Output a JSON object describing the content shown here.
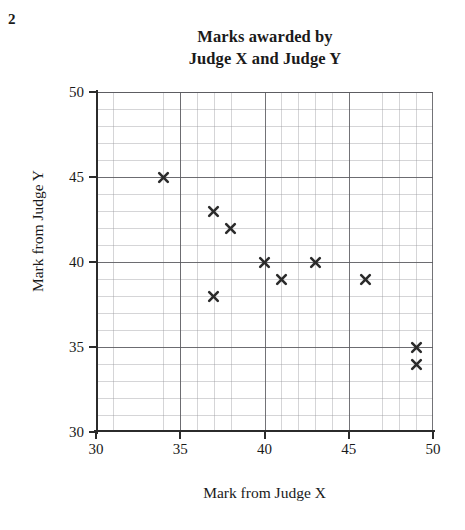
{
  "question_number": "2",
  "chart_data": {
    "type": "scatter",
    "title": "Marks awarded by Judge X and Judge Y",
    "title_lines": [
      "Marks awarded by",
      "Judge X and Judge Y"
    ],
    "xlabel": "Mark from Judge X",
    "ylabel": "Mark from Judge Y",
    "xlim": [
      30,
      50
    ],
    "ylim": [
      30,
      50
    ],
    "x_ticks": [
      30,
      35,
      40,
      45,
      50
    ],
    "y_ticks": [
      30,
      35,
      40,
      45,
      50
    ],
    "x_tick_labels": [
      "30",
      "35",
      "40",
      "45",
      "50"
    ],
    "y_tick_labels": [
      "30",
      "35",
      "40",
      "45",
      "50"
    ],
    "grid": true,
    "grid_major_step": 5,
    "grid_minor_step": 1,
    "legend": null,
    "marker": "x-cross",
    "marker_color": "#2b2b2b",
    "points": [
      {
        "x": 34,
        "y": 45
      },
      {
        "x": 37,
        "y": 43
      },
      {
        "x": 38,
        "y": 42
      },
      {
        "x": 37,
        "y": 38
      },
      {
        "x": 40,
        "y": 40
      },
      {
        "x": 41,
        "y": 39
      },
      {
        "x": 43,
        "y": 40
      },
      {
        "x": 46,
        "y": 39
      },
      {
        "x": 49,
        "y": 35
      },
      {
        "x": 49,
        "y": 34
      }
    ]
  }
}
